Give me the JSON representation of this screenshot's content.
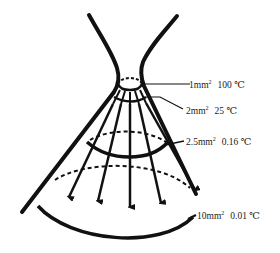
{
  "diagram": {
    "stroke_color": "#111111",
    "background": "#ffffff",
    "sections": [
      {
        "area_value": "1mm",
        "area_exp": "2",
        "temperature": "100 ℃"
      },
      {
        "area_value": "2mm",
        "area_exp": "2",
        "temperature": "25 ℃"
      },
      {
        "area_value": "2.5mm",
        "area_exp": "2",
        "temperature": "0.16 ℃"
      },
      {
        "area_value": "10mm",
        "area_exp": "2",
        "temperature": "0.01 ℃"
      }
    ],
    "arrow_count": 5
  }
}
